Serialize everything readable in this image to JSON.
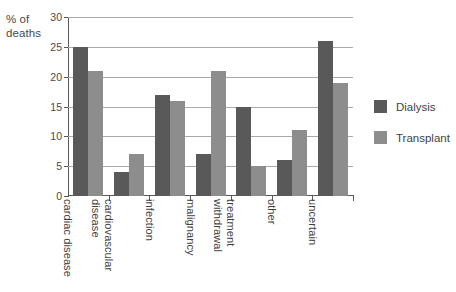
{
  "chart_data": {
    "type": "bar",
    "title": "",
    "subtitle": "",
    "xlabel": "",
    "ylabel": "% of deaths",
    "ylim": [
      0,
      30
    ],
    "yticks": [
      0,
      5,
      10,
      15,
      20,
      25,
      30
    ],
    "ytick_labels": [
      "0",
      "5",
      "10",
      "15",
      "20",
      "25",
      "30"
    ],
    "grid": true,
    "legend_position": "right",
    "categories": [
      "cardiac disease",
      "cardiovascular disease",
      "infection",
      "malignancy",
      "treatment withdrawal",
      "other",
      "uncertain"
    ],
    "category_lines": [
      [
        "cardiac disease",
        ""
      ],
      [
        "cardiovascular",
        "disease"
      ],
      [
        "infection",
        ""
      ],
      [
        "malignancy",
        ""
      ],
      [
        "treatment",
        "withdrawal"
      ],
      [
        "other",
        ""
      ],
      [
        "uncertain",
        ""
      ]
    ],
    "series": [
      {
        "name": "Dialysis",
        "color": "#595959",
        "values": [
          25,
          4,
          17,
          7,
          15,
          6,
          26
        ]
      },
      {
        "name": "Transplant",
        "color": "#8d8d8d",
        "values": [
          21,
          7,
          16,
          21,
          5,
          11,
          19
        ]
      }
    ]
  },
  "axis": {
    "y_title_line1": "% of",
    "y_title_line2": "deaths"
  },
  "legend": {
    "items": [
      {
        "label": "Dialysis",
        "color": "#595959"
      },
      {
        "label": "Transplant",
        "color": "#8d8d8d"
      }
    ]
  }
}
